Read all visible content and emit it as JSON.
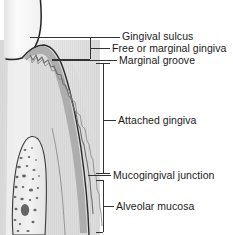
{
  "figure": {
    "colors": {
      "background": "#ffffff",
      "tooth_enamel": "#f2f2f2",
      "gingiva_fill": "#d9d9d9",
      "gingiva_epithelium": "#a8a8a8",
      "connective_tissue": "#e2e2e2",
      "alveolar_bone": "#ededed",
      "bone_trabeculae": "#5a5a5a",
      "outline": "#2b2b2b",
      "leader_line": "#3a3a3a",
      "text": "#1a1a1a"
    },
    "labels": [
      {
        "id": "gingival-sulcus",
        "text": "Gingival sulcus",
        "leader": "line"
      },
      {
        "id": "free-marginal",
        "text": "Free or marginal gingiva",
        "leader": "bracket"
      },
      {
        "id": "marginal-groove",
        "text": "Marginal groove",
        "leader": "line"
      },
      {
        "id": "attached-gingiva",
        "text": "Attached gingiva",
        "leader": "bracket"
      },
      {
        "id": "mucogingival",
        "text": "Mucogingival junction",
        "leader": "line"
      },
      {
        "id": "alveolar-mucosa",
        "text": "Alveolar mucosa",
        "leader": "bracket"
      }
    ]
  }
}
